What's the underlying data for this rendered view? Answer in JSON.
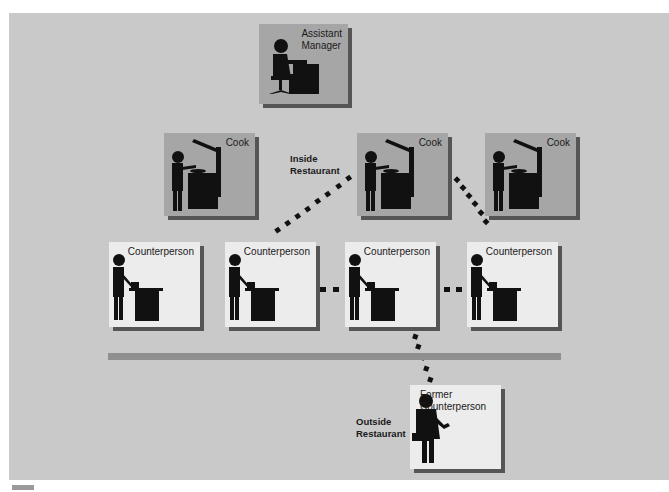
{
  "diagram": {
    "type": "organization-network",
    "background_color": "#c9c9c9",
    "nodes": [
      {
        "id": "assistant-manager",
        "label_lines": [
          "Assistant",
          "Manager"
        ],
        "icon": "seated-person-at-desk-icon",
        "fill": "#a6a6a6"
      },
      {
        "id": "cook-1",
        "label": "Cook",
        "icon": "cook-at-stove-icon",
        "fill": "#a6a6a6"
      },
      {
        "id": "cook-2",
        "label": "Cook",
        "icon": "cook-at-stove-icon",
        "fill": "#a6a6a6"
      },
      {
        "id": "cook-3",
        "label": "Cook",
        "icon": "cook-at-stove-icon",
        "fill": "#a6a6a6"
      },
      {
        "id": "counterperson-1",
        "label": "Counterperson",
        "icon": "person-at-register-icon",
        "fill": "#ececec"
      },
      {
        "id": "counterperson-2",
        "label": "Counterperson",
        "icon": "person-at-register-icon",
        "fill": "#ececec"
      },
      {
        "id": "counterperson-3",
        "label": "Counterperson",
        "icon": "person-at-register-icon",
        "fill": "#ececec"
      },
      {
        "id": "counterperson-4",
        "label": "Counterperson",
        "icon": "person-at-register-icon",
        "fill": "#ececec"
      },
      {
        "id": "former-counterperson",
        "label_lines": [
          "Former",
          "Counterperson"
        ],
        "icon": "person-with-briefcase-icon",
        "fill": "#ececec"
      }
    ],
    "links": [
      {
        "from": "counterperson-2",
        "to": "cook-2",
        "style": "dotted"
      },
      {
        "from": "cook-2",
        "to": "counterperson-4",
        "style": "dotted"
      },
      {
        "from": "counterperson-2",
        "to": "counterperson-3",
        "style": "dotted"
      },
      {
        "from": "counterperson-3",
        "to": "counterperson-4",
        "style": "dotted"
      },
      {
        "from": "counterperson-3",
        "to": "former-counterperson",
        "style": "dotted"
      }
    ],
    "zones": {
      "inside": {
        "label_lines": [
          "Inside",
          "Restaurant"
        ]
      },
      "outside": {
        "label_lines": [
          "Outside",
          "Restaurant"
        ]
      }
    }
  }
}
